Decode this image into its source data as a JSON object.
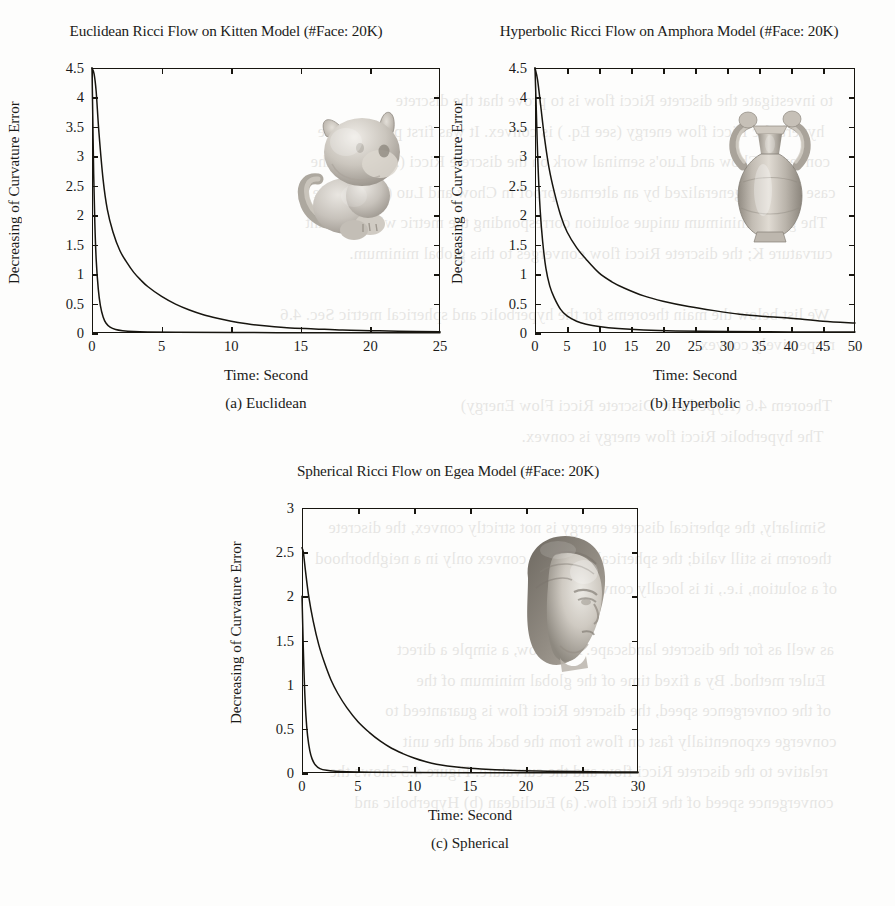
{
  "page": {
    "background_color": "#fdfdfc",
    "ink_color": "#17150f",
    "bleed_through_lines": [
      "to investigate the discrete Ricci flow is to prove that the discrete",
      "hyperbolic Ricci flow energy (see Eq.  ) is convex. It was first proved to be",
      "convex in Chow and Luo's seminal work on the discrete Ricci (2003) for the",
      "case and was generalized by an alternate proof in Chow and Luo (2003). The",
      "The global minimum unique solution corresponding the metric with constant",
      "curvature K; the discrete Ricci flow converges to this global minimum.",
      "",
      "We list below the main theorems for the hyperbolic and spherical metric Sec. 4.6",
      "respectively convex.",
      "",
      "Theorem 4.6 (Hyperbolic Discrete Ricci Flow Energy)",
      "The hyperbolic Ricci flow energy is convex.",
      "",
      "",
      "Similarly, the spherical discrete energy is not strictly convex, the discrete",
      "theorem is still valid; the spherical energy is convex only in a neighborhood",
      "of a solution, i.e., it is locally convex but...",
      "",
      "as well as for the discrete landscape. As a flow, a simple a direct",
      "Euler method. By a fixed time of the global minimum of the",
      "of the convergence speed, the discrete Ricci flow is guaranteed to",
      "converge exponentially fast on flows from the back and the unit",
      "relative to the discrete Ricci flow and the curvature. Figure 4.5 shows the",
      "convergence speed of the Ricci flow. (a) Euclidean (b) Hyperbolic and"
    ]
  },
  "figure": {
    "charts": [
      {
        "id": "euclidean",
        "title": "Euclidean Ricci Flow on Kitten Model (#Face: 20K)",
        "caption": "(a) Euclidean",
        "model_name": "kitten",
        "chart_data": {
          "type": "line",
          "title": "Euclidean Ricci Flow on Kitten Model (#Face: 20K)",
          "xlabel": "Time: Second",
          "ylabel": "Decreasing of Curvature Error",
          "xlim": [
            0,
            25
          ],
          "ylim": [
            0,
            4.5
          ],
          "xticks": [
            "0",
            "5",
            "10",
            "15",
            "20",
            "25"
          ],
          "xtick_values": [
            0,
            5,
            10,
            15,
            20,
            25
          ],
          "yticks": [
            "0",
            "0.5",
            "1",
            "1.5",
            "2",
            "2.5",
            "3",
            "3.5",
            "4",
            "4.5"
          ],
          "ytick_values": [
            0,
            0.5,
            1,
            1.5,
            2,
            2.5,
            3,
            3.5,
            4,
            4.5
          ],
          "grid": false,
          "legend": "none",
          "series": [
            {
              "name": "slow-decay",
              "x": [
                0,
                0.15,
                0.3,
                0.5,
                0.8,
                1.1,
                1.5,
                2,
                2.5,
                3,
                3.5,
                4,
                5,
                6,
                7,
                8,
                9,
                10,
                11,
                12,
                14,
                16,
                18,
                20,
                22,
                25
              ],
              "values": [
                4.5,
                4.4,
                4.1,
                3.4,
                2.6,
                2.1,
                1.72,
                1.4,
                1.2,
                1.03,
                0.9,
                0.79,
                0.62,
                0.49,
                0.39,
                0.31,
                0.25,
                0.2,
                0.16,
                0.13,
                0.09,
                0.07,
                0.05,
                0.04,
                0.03,
                0.02
              ]
            },
            {
              "name": "fast-decay",
              "x": [
                0,
                0.06,
                0.12,
                0.2,
                0.3,
                0.45,
                0.6,
                0.8,
                1.0,
                1.3,
                1.7,
                2.2,
                3,
                4,
                6,
                10,
                15,
                20,
                25
              ],
              "values": [
                4.5,
                3.6,
                2.7,
                1.9,
                1.25,
                0.75,
                0.47,
                0.27,
                0.17,
                0.1,
                0.06,
                0.04,
                0.025,
                0.018,
                0.012,
                0.008,
                0.005,
                0.004,
                0.003
              ]
            }
          ]
        }
      },
      {
        "id": "hyperbolic",
        "title": "Hyperbolic Ricci Flow on Amphora Model (#Face: 20K)",
        "caption": "(b) Hyperbolic",
        "model_name": "amphora",
        "chart_data": {
          "type": "line",
          "title": "Hyperbolic Ricci Flow on Amphora Model (#Face: 20K)",
          "xlabel": "Time: Second",
          "ylabel": "Decreasing of Curvature Error",
          "xlim": [
            0,
            50
          ],
          "ylim": [
            0,
            4.5
          ],
          "xticks": [
            "0",
            "5",
            "10",
            "15",
            "20",
            "25",
            "30",
            "35",
            "40",
            "45",
            "50"
          ],
          "xtick_values": [
            0,
            5,
            10,
            15,
            20,
            25,
            30,
            35,
            40,
            45,
            50
          ],
          "yticks": [
            "0",
            "0.5",
            "1",
            "1.5",
            "2",
            "2.5",
            "3",
            "3.5",
            "4",
            "4.5"
          ],
          "ytick_values": [
            0,
            0.5,
            1,
            1.5,
            2,
            2.5,
            3,
            3.5,
            4,
            4.5
          ],
          "grid": false,
          "legend": "none",
          "series": [
            {
              "name": "slow-decay",
              "x": [
                0,
                0.4,
                0.9,
                1.5,
                2.2,
                3,
                4,
                5,
                6.5,
                8,
                10,
                12,
                14,
                17,
                20,
                24,
                28,
                32,
                36,
                40,
                45,
                50
              ],
              "values": [
                4.5,
                4.3,
                3.85,
                3.3,
                2.8,
                2.4,
                2.0,
                1.72,
                1.45,
                1.25,
                1.02,
                0.87,
                0.76,
                0.63,
                0.54,
                0.45,
                0.38,
                0.32,
                0.28,
                0.25,
                0.2,
                0.17
              ]
            },
            {
              "name": "fast-decay",
              "x": [
                0,
                0.2,
                0.45,
                0.8,
                1.2,
                1.7,
                2.3,
                3,
                4,
                5,
                6.5,
                8,
                10,
                13,
                17,
                22,
                30,
                40,
                50
              ],
              "values": [
                4.5,
                3.8,
                2.9,
                2.1,
                1.55,
                1.1,
                0.8,
                0.6,
                0.4,
                0.29,
                0.2,
                0.15,
                0.11,
                0.075,
                0.05,
                0.035,
                0.025,
                0.018,
                0.015
              ]
            }
          ]
        }
      },
      {
        "id": "spherical",
        "title": "Spherical Ricci Flow on Egea Model (#Face: 20K)",
        "caption": "(c) Spherical",
        "model_name": "egea",
        "chart_data": {
          "type": "line",
          "title": "Spherical Ricci Flow on Egea Model (#Face: 20K)",
          "xlabel": "Time: Second",
          "ylabel": "Decreasing of Curvature Error",
          "xlim": [
            0,
            30
          ],
          "ylim": [
            0,
            3
          ],
          "xticks": [
            "0",
            "5",
            "10",
            "15",
            "20",
            "25",
            "30"
          ],
          "xtick_values": [
            0,
            5,
            10,
            15,
            20,
            25,
            30
          ],
          "yticks": [
            "0",
            "0.5",
            "1",
            "1.5",
            "2",
            "2.5",
            "3"
          ],
          "ytick_values": [
            0,
            0.5,
            1,
            1.5,
            2,
            2.5,
            3
          ],
          "grid": false,
          "legend": "none",
          "series": [
            {
              "name": "slow-decay",
              "x": [
                0,
                0.12,
                0.3,
                0.6,
                1.0,
                1.5,
                2,
                2.6,
                3.2,
                4,
                5,
                6,
                7,
                8,
                9,
                10,
                11,
                12,
                14,
                16,
                19,
                22,
                26,
                30
              ],
              "values": [
                2.55,
                2.5,
                2.3,
                2.0,
                1.72,
                1.45,
                1.25,
                1.05,
                0.9,
                0.74,
                0.58,
                0.46,
                0.36,
                0.28,
                0.22,
                0.17,
                0.13,
                0.1,
                0.065,
                0.045,
                0.028,
                0.02,
                0.014,
                0.01
              ]
            },
            {
              "name": "fast-decay",
              "x": [
                0,
                0.05,
                0.12,
                0.22,
                0.35,
                0.5,
                0.7,
                0.9,
                1.2,
                1.6,
                2.2,
                3,
                4,
                6,
                10,
                15,
                22,
                30
              ],
              "values": [
                2.0,
                1.75,
                1.4,
                1.0,
                0.65,
                0.42,
                0.25,
                0.16,
                0.09,
                0.05,
                0.03,
                0.02,
                0.014,
                0.009,
                0.006,
                0.004,
                0.003,
                0.002
              ]
            }
          ]
        }
      }
    ]
  }
}
